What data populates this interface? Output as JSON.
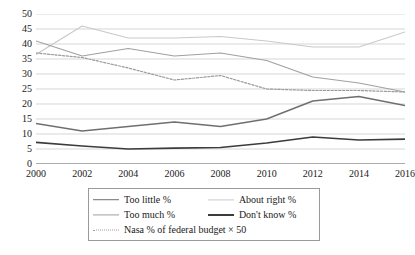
{
  "chart_data": {
    "type": "line",
    "title": "",
    "subtitle": "",
    "xlabel": "",
    "ylabel": "",
    "categories": [
      "2000",
      "2002",
      "2004",
      "2006",
      "2008",
      "2010",
      "2012",
      "2014",
      "2016"
    ],
    "x": [
      2000,
      2002,
      2004,
      2006,
      2008,
      2010,
      2012,
      2014,
      2016
    ],
    "xlim": [
      2000,
      2016
    ],
    "ylim": [
      0,
      50
    ],
    "y_ticks": [
      0,
      5,
      10,
      15,
      20,
      25,
      30,
      35,
      40,
      45,
      50
    ],
    "y_tick_labels": [
      "0",
      "5",
      "10",
      "15",
      "20",
      "25",
      "30",
      "35",
      "40",
      "45",
      "50"
    ],
    "grid": "horizontal",
    "legend_position": "bottom",
    "series": [
      {
        "name": "Too little %",
        "color": "#6f6f6f",
        "style": "solid",
        "width": 1.4,
        "values": [
          13.5,
          11.0,
          12.5,
          14.0,
          12.5,
          15.0,
          21.0,
          22.5,
          19.5
        ]
      },
      {
        "name": "About right %",
        "color": "#c9c9c9",
        "style": "solid",
        "width": 1.1,
        "values": [
          36.5,
          46.0,
          42.0,
          42.0,
          42.5,
          41.0,
          39.0,
          39.0,
          44.0
        ]
      },
      {
        "name": "Too much %",
        "color": "#a0a0a0",
        "style": "solid",
        "width": 1.1,
        "values": [
          41.0,
          36.0,
          38.5,
          36.0,
          37.0,
          34.5,
          29.0,
          27.0,
          24.0
        ]
      },
      {
        "name": "Don't know %",
        "color": "#3c3c3c",
        "style": "solid",
        "width": 1.7,
        "values": [
          7.2,
          6.0,
          5.0,
          5.3,
          5.5,
          7.0,
          9.0,
          8.0,
          8.3
        ]
      },
      {
        "name": "Nasa % of federal budget × 50",
        "color": "#9b9b9b",
        "style": "dotted",
        "width": 1.2,
        "values": [
          37.0,
          35.5,
          32.0,
          28.0,
          29.5,
          25.0,
          24.5,
          24.5,
          24.0
        ]
      }
    ]
  },
  "legend": {
    "rows": [
      [
        {
          "name": "Too little %",
          "color": "#6f6f6f",
          "style": "solid",
          "width": 1.6
        },
        {
          "name": "About right %",
          "color": "#c9c9c9",
          "style": "solid",
          "width": 1.2
        }
      ],
      [
        {
          "name": "Too much %",
          "color": "#a0a0a0",
          "style": "solid",
          "width": 1.2
        },
        {
          "name": "Don't know %",
          "color": "#3c3c3c",
          "style": "solid",
          "width": 2.0
        }
      ],
      [
        {
          "name": "Nasa % of federal budget × 50",
          "color": "#9b9b9b",
          "style": "dotted",
          "width": 1.4
        }
      ]
    ]
  },
  "style": {
    "gridline_color": "#c4c4c4",
    "axis_color": "#5a5a5a",
    "text_color": "#1a1a1a",
    "background": "#ffffff",
    "legend_border": "#9a9a9a"
  }
}
